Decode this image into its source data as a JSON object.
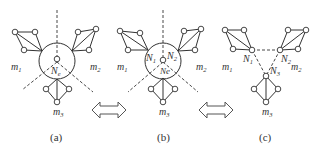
{
  "figure": {
    "panels": [
      {
        "id": "a",
        "caption": "(a)",
        "center_label": "N",
        "center_sub": "e",
        "clusters": [
          {
            "label": "m",
            "sub": "1"
          },
          {
            "label": "m",
            "sub": "2"
          },
          {
            "label": "m",
            "sub": "3"
          }
        ]
      },
      {
        "id": "b",
        "caption": "(b)",
        "nodes": [
          {
            "label": "N",
            "sub": "1"
          },
          {
            "label": "N",
            "sub": "2"
          },
          {
            "label": "Ne",
            "sub": ""
          }
        ],
        "clusters": [
          {
            "label": "m",
            "sub": "1"
          },
          {
            "label": "m",
            "sub": "2"
          },
          {
            "label": "m",
            "sub": "3"
          }
        ]
      },
      {
        "id": "c",
        "caption": "(c)",
        "nodes": [
          {
            "label": "N",
            "sub": "1"
          },
          {
            "label": "N",
            "sub": "2"
          },
          {
            "label": "N",
            "sub": "3"
          }
        ],
        "clusters": [
          {
            "label": "m",
            "sub": "1"
          },
          {
            "label": "m",
            "sub": "2"
          },
          {
            "label": "m",
            "sub": "3"
          }
        ]
      }
    ],
    "arrows": [
      {
        "type": "double-arrow",
        "between": "a-b"
      },
      {
        "type": "double-arrow",
        "between": "b-c"
      }
    ]
  }
}
